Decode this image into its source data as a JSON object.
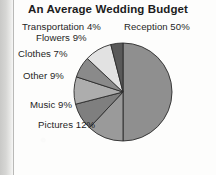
{
  "chart_data": {
    "type": "pie",
    "title": "An Average Wedding Budget",
    "xlabel": "",
    "ylabel": "",
    "legend_position": "none",
    "labels_outside": true,
    "categories": [
      "Reception",
      "Pictures",
      "Music",
      "Other",
      "Clothes",
      "Flowers",
      "Transportation"
    ],
    "values": [
      50,
      12,
      9,
      9,
      7,
      9,
      4
    ],
    "unit": "%",
    "slice_labels": [
      "Reception 50%",
      "Pictures 12%",
      "Music 9%",
      "Other 9%",
      "Clothes 7%",
      "Flowers 9%",
      "Transportation 4%"
    ],
    "slice_colors": [
      "#8f8f8f",
      "#9a9a9a",
      "#7f7f7f",
      "#adadad",
      "#8a8a8a",
      "#e2e2e2",
      "#595959"
    ],
    "start_angle_deg": 0,
    "direction": "clockwise"
  },
  "chart": {
    "title": "An Average Wedding Budget",
    "labels": {
      "reception": "Reception 50%",
      "pictures": "Pictures 12%",
      "music": "Music 9%",
      "other": "Other 9%",
      "clothes": "Clothes 7%",
      "flowers": "Flowers 9%",
      "transportation": "Transportation 4%"
    }
  },
  "colors": {
    "text": "#1f1f1f",
    "title": "#1c1c1c",
    "background": "#fdfdfc",
    "slice_outline": "#2b2b2b"
  }
}
